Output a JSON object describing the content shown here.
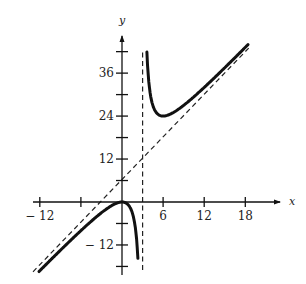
{
  "chart_data": {
    "type": "line",
    "title": "",
    "xlabel": "x",
    "ylabel": "y",
    "function": "y = 2x^2/(x - 3)",
    "xlim": [
      -13,
      20
    ],
    "ylim": [
      -19,
      46
    ],
    "x_ticks": [
      -12,
      -6,
      6,
      12,
      18
    ],
    "x_tick_labels": [
      "−12",
      "",
      "6",
      "12",
      "18"
    ],
    "y_ticks": [
      -18,
      -12,
      -6,
      6,
      12,
      18,
      24,
      30,
      36,
      42
    ],
    "y_tick_labels": [
      "",
      "−12",
      "",
      "",
      "12",
      "",
      "24",
      "",
      "36",
      ""
    ],
    "grid": false,
    "legend": null,
    "series": [
      {
        "name": "f(x) left branch",
        "style": "solid",
        "x": [
          -12.6,
          -12,
          -9,
          -6,
          -3,
          -1,
          0,
          1,
          2,
          2.5,
          2.7
        ],
        "y": [
          -18.6,
          -17.6,
          -13.5,
          -8,
          -3,
          -0.5,
          0,
          -1,
          -8,
          -25,
          -48.6
        ]
      },
      {
        "name": "f(x) right branch",
        "style": "solid",
        "x": [
          3.25,
          3.5,
          4,
          5,
          6,
          7,
          9,
          12,
          15,
          18.4
        ],
        "y": [
          84.5,
          49,
          32,
          25,
          24,
          24.5,
          27,
          32,
          37.5,
          44
        ]
      },
      {
        "name": "oblique asymptote y = 2x + 6",
        "style": "dashed",
        "x": [
          -13,
          18.5
        ],
        "y": [
          -20,
          43
        ]
      },
      {
        "name": "vertical asymptote x = 3",
        "style": "dashed",
        "x": [
          3,
          3
        ],
        "y": [
          -19,
          42
        ]
      }
    ],
    "annotations": {
      "vertical_asymptote": "x = 3",
      "oblique_asymptote": "y = 2x + 6",
      "local_max": [
        0,
        0
      ],
      "local_min": [
        6,
        24
      ]
    }
  },
  "axes": {
    "x_label": "x",
    "y_label": "y",
    "x_ticks": [
      {
        "value": -12,
        "label": "− 12"
      },
      {
        "value": -6,
        "label": ""
      },
      {
        "value": 6,
        "label": "6"
      },
      {
        "value": 12,
        "label": "12"
      },
      {
        "value": 18,
        "label": "18"
      }
    ],
    "y_ticks": [
      {
        "value": 42,
        "label": ""
      },
      {
        "value": 36,
        "label": "36"
      },
      {
        "value": 30,
        "label": ""
      },
      {
        "value": 24,
        "label": "24"
      },
      {
        "value": 18,
        "label": ""
      },
      {
        "value": 12,
        "label": "12"
      },
      {
        "value": 6,
        "label": ""
      },
      {
        "value": -6,
        "label": ""
      },
      {
        "value": -12,
        "label": "− 12"
      },
      {
        "value": -18,
        "label": ""
      }
    ]
  }
}
